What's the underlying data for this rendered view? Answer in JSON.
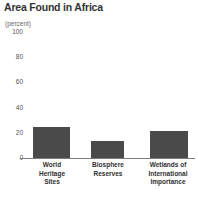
{
  "chart_data": {
    "type": "bar",
    "title": "Area Found in Africa",
    "unit_label": "(percent)",
    "xlabel": "",
    "ylabel": "",
    "ylim": [
      0,
      100
    ],
    "yticks": [
      {
        "value": 100,
        "label": "100"
      },
      {
        "value": 80,
        "label": "80"
      },
      {
        "value": 60,
        "label": "60"
      },
      {
        "value": 40,
        "label": "40"
      },
      {
        "value": 20,
        "label": "20"
      },
      {
        "value": 0,
        "label": "0"
      }
    ],
    "grid": false,
    "legend": "none",
    "bar_color": "#4a4a4a",
    "axis_color": "#7d7d7d",
    "categories": [
      "World\nHeritage\nSites",
      "Biosphere\nReserves",
      "Wetlands of\nInternational\nImportance"
    ],
    "values": [
      24,
      13,
      21
    ]
  }
}
